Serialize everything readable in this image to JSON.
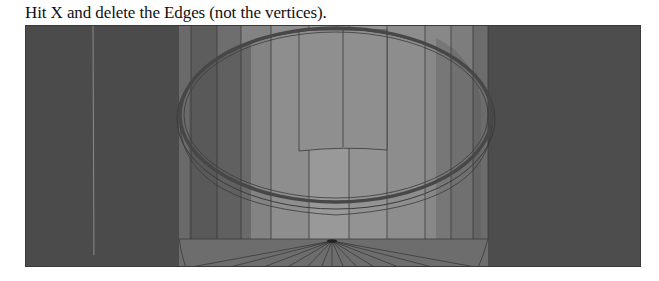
{
  "caption": "Hit X and delete the Edges (not the vertices).",
  "viewport": {
    "label": "3D viewport - cylinder mesh, top view",
    "colors": {
      "background": "#4a4a4a",
      "panel_dark": "#4c4c4c",
      "panel_mid": "#777777",
      "panel_light": "#8d8d8d",
      "panel_lighter": "#9a9a9a",
      "edge": "#333333",
      "ring": "#555555"
    }
  }
}
